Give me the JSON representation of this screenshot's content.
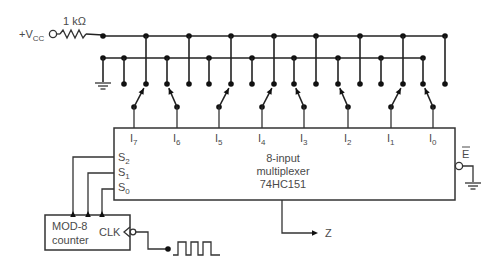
{
  "supply": {
    "label_main": "+V",
    "label_sub": "CC",
    "resistor_label": "1 kΩ"
  },
  "multiplexer": {
    "title_line1": "8-input",
    "title_line2": "multiplexer",
    "part_number": "74HC151",
    "inputs": [
      {
        "main": "I",
        "sub": "7",
        "switch_state": "HIGH"
      },
      {
        "main": "I",
        "sub": "6",
        "switch_state": "LOW"
      },
      {
        "main": "I",
        "sub": "5",
        "switch_state": "HIGH"
      },
      {
        "main": "I",
        "sub": "4",
        "switch_state": "HIGH"
      },
      {
        "main": "I",
        "sub": "3",
        "switch_state": "LOW"
      },
      {
        "main": "I",
        "sub": "2",
        "switch_state": "LOW"
      },
      {
        "main": "I",
        "sub": "1",
        "switch_state": "HIGH"
      },
      {
        "main": "I",
        "sub": "0",
        "switch_state": "LOW"
      }
    ],
    "selects": [
      {
        "main": "S",
        "sub": "2"
      },
      {
        "main": "S",
        "sub": "1"
      },
      {
        "main": "S",
        "sub": "0"
      }
    ],
    "enable_label": "E",
    "enable_active_low": true,
    "output_label": "Z"
  },
  "counter": {
    "line1": "MOD-8",
    "line2": "counter",
    "clock_label": "CLK"
  },
  "colors": {
    "wire": "#222222",
    "s2_wire": "#2a2a8a",
    "text": "#4a4a4a"
  }
}
